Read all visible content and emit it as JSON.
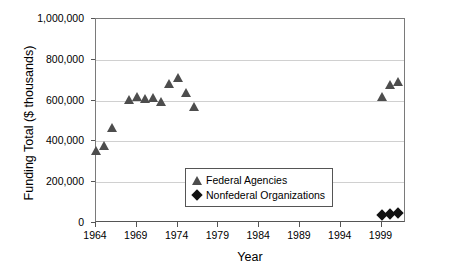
{
  "chart_data": {
    "type": "scatter",
    "title": "",
    "xlabel": "Year",
    "ylabel": "Funding Total ($ thousands)",
    "xlim": [
      1964,
      2002
    ],
    "ylim": [
      0,
      1000000
    ],
    "grid": true,
    "legend_position": "inside-lower-center",
    "x_ticks": [
      "1964",
      "1969",
      "1974",
      "1979",
      "1984",
      "1989",
      "1994",
      "1999"
    ],
    "x_tick_values": [
      1964,
      1969,
      1974,
      1979,
      1984,
      1989,
      1994,
      1999
    ],
    "y_ticks": [
      "0",
      "200,000",
      "400,000",
      "600,000",
      "800,000",
      "1,000,000"
    ],
    "y_tick_values": [
      0,
      200000,
      400000,
      600000,
      800000,
      1000000
    ],
    "series": [
      {
        "name": "Federal Agencies",
        "marker": "triangle",
        "color": "#4d4d4d",
        "points": [
          {
            "x": 1964,
            "y": 355000
          },
          {
            "x": 1965,
            "y": 380000
          },
          {
            "x": 1966,
            "y": 470000
          },
          {
            "x": 1968,
            "y": 605000
          },
          {
            "x": 1969,
            "y": 620000
          },
          {
            "x": 1970,
            "y": 610000
          },
          {
            "x": 1971,
            "y": 615000
          },
          {
            "x": 1972,
            "y": 595000
          },
          {
            "x": 1973,
            "y": 685000
          },
          {
            "x": 1974,
            "y": 715000
          },
          {
            "x": 1975,
            "y": 640000
          },
          {
            "x": 1976,
            "y": 570000
          },
          {
            "x": 1999,
            "y": 620000
          },
          {
            "x": 2000,
            "y": 680000
          },
          {
            "x": 2001,
            "y": 695000
          }
        ]
      },
      {
        "name": "Nonfederal Organizations",
        "marker": "diamond",
        "color": "#111111",
        "points": [
          {
            "x": 1999,
            "y": 38000
          },
          {
            "x": 2000,
            "y": 42000
          },
          {
            "x": 2001,
            "y": 47000
          }
        ]
      }
    ]
  },
  "legend": {
    "items": [
      {
        "label": "Federal Agencies",
        "marker": "triangle"
      },
      {
        "label": "Nonfederal Organizations",
        "marker": "diamond"
      }
    ]
  }
}
